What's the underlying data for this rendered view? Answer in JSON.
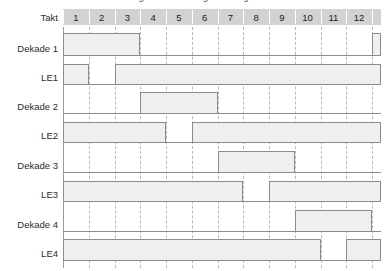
{
  "figure": {
    "clipped_caption": "Zeitlicher Ablauf der Ansteuerung einer vierstelligen Anzeige",
    "axis_label": "Takt",
    "tick_labels": [
      "1",
      "2",
      "3",
      "4",
      "5",
      "6",
      "7",
      "8",
      "9",
      "10",
      "11",
      "12"
    ],
    "tick_count": 12,
    "partial_tick_visible": true,
    "colors": {
      "header_fill": "#d2d2d2",
      "pulse_fill": "#efefef",
      "line": "#8c8c8c",
      "grid": "#b9b9b9",
      "text": "#2b2b2b"
    }
  },
  "chart_data": {
    "type": "timing",
    "title": "Zeitlicher Ablauf der Ansteuerung einer vierstelligen Anzeige",
    "xlabel": "Takt",
    "x": [
      1,
      2,
      3,
      4,
      5,
      6,
      7,
      8,
      9,
      10,
      11,
      12
    ],
    "xlim": [
      1,
      13
    ],
    "grid": true,
    "legend": "none",
    "signals": [
      {
        "name": "Dekade 1",
        "high_intervals": [
          [
            1,
            4
          ],
          [
            13,
            13.6
          ]
        ],
        "values": [
          1,
          1,
          1,
          0,
          0,
          0,
          0,
          0,
          0,
          0,
          0,
          0
        ]
      },
      {
        "name": "LE1",
        "high_intervals": [
          [
            1,
            2
          ],
          [
            3,
            13.6
          ]
        ],
        "values": [
          1,
          0,
          1,
          1,
          1,
          1,
          1,
          1,
          1,
          1,
          1,
          1
        ]
      },
      {
        "name": "Dekade 2",
        "high_intervals": [
          [
            4,
            7
          ]
        ],
        "values": [
          0,
          0,
          0,
          1,
          1,
          1,
          0,
          0,
          0,
          0,
          0,
          0
        ]
      },
      {
        "name": "LE2",
        "high_intervals": [
          [
            1,
            5
          ],
          [
            6,
            13.6
          ]
        ],
        "values": [
          1,
          1,
          1,
          1,
          0,
          1,
          1,
          1,
          1,
          1,
          1,
          1
        ]
      },
      {
        "name": "Dekade 3",
        "high_intervals": [
          [
            7,
            10
          ]
        ],
        "values": [
          0,
          0,
          0,
          0,
          0,
          0,
          1,
          1,
          1,
          0,
          0,
          0
        ]
      },
      {
        "name": "LE3",
        "high_intervals": [
          [
            1,
            8
          ],
          [
            9,
            13.6
          ]
        ],
        "values": [
          1,
          1,
          1,
          1,
          1,
          1,
          1,
          0,
          1,
          1,
          1,
          1
        ]
      },
      {
        "name": "Dekade 4",
        "high_intervals": [
          [
            10,
            13
          ]
        ],
        "values": [
          0,
          0,
          0,
          0,
          0,
          0,
          0,
          0,
          0,
          1,
          1,
          1
        ]
      },
      {
        "name": "LE4",
        "high_intervals": [
          [
            1,
            11
          ],
          [
            12,
            13.6
          ]
        ],
        "values": [
          1,
          1,
          1,
          1,
          1,
          1,
          1,
          1,
          1,
          1,
          0,
          1
        ]
      }
    ]
  }
}
